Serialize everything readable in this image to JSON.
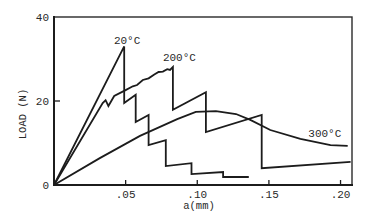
{
  "chart_data": {
    "type": "line",
    "title": "",
    "xlabel": "a(mm)",
    "ylabel": "LOAD (N)",
    "xlim": [
      0,
      0.208
    ],
    "ylim": [
      0,
      40
    ],
    "xticks": [
      0.05,
      0.1,
      0.15,
      0.2
    ],
    "xtick_labels": [
      ".05",
      ".10",
      ".15",
      ".20"
    ],
    "yticks": [
      0,
      20,
      40
    ],
    "ytick_labels": [
      "0",
      "20",
      "40"
    ],
    "grid": false,
    "legend": null,
    "series": [
      {
        "name": "20°C",
        "x": [
          0,
          0.049,
          0.049,
          0.057,
          0.057,
          0.066,
          0.066,
          0.078,
          0.078,
          0.096,
          0.096,
          0.118,
          0.118,
          0.136
        ],
        "y": [
          0,
          33.0,
          19.5,
          21.5,
          15.0,
          16.7,
          9.5,
          10.7,
          4.5,
          5.2,
          2.6,
          3.1,
          1.9,
          1.9
        ]
      },
      {
        "name": "200°C",
        "x": [
          0,
          0.034,
          0.036,
          0.038,
          0.042,
          0.05,
          0.055,
          0.058,
          0.062,
          0.066,
          0.07,
          0.073,
          0.076,
          0.079,
          0.081,
          0.083,
          0.083,
          0.106,
          0.106,
          0.145,
          0.145,
          0.207
        ],
        "y": [
          0,
          19.5,
          20.2,
          18.8,
          21.2,
          22.6,
          23.5,
          23.8,
          25.0,
          25.4,
          26.3,
          26.9,
          27.0,
          27.6,
          27.4,
          28.1,
          17.9,
          22.1,
          12.6,
          16.7,
          4.0,
          5.5
        ]
      },
      {
        "name": "300°C",
        "x": [
          0,
          0.032,
          0.06,
          0.086,
          0.099,
          0.113,
          0.127,
          0.137,
          0.151,
          0.172,
          0.193,
          0.205
        ],
        "y": [
          0,
          6.4,
          11.7,
          15.7,
          17.4,
          17.6,
          16.9,
          15.5,
          13.1,
          11.0,
          9.5,
          9.3
        ]
      }
    ],
    "annotations": [
      {
        "text": "20°C",
        "x": 0.051,
        "y": 34.6
      },
      {
        "text": "200°C",
        "x": 0.0875,
        "y": 30.5
      },
      {
        "text": "300°C",
        "x": 0.189,
        "y": 12.4
      }
    ]
  }
}
